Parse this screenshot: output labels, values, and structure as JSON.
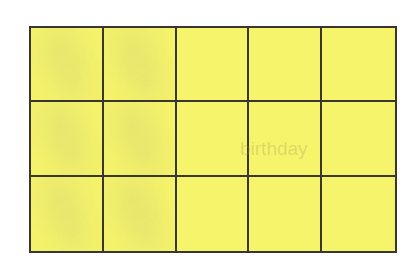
{
  "grid": {
    "columns": 5,
    "rows": 3,
    "cell_color": "#f6f46a",
    "line_color": "#3a3530",
    "cells": [
      [
        "",
        "",
        "",
        "",
        ""
      ],
      [
        "",
        "",
        "",
        "",
        ""
      ],
      [
        "",
        "",
        "",
        "",
        ""
      ]
    ]
  },
  "bleed_through_text": "birthday"
}
